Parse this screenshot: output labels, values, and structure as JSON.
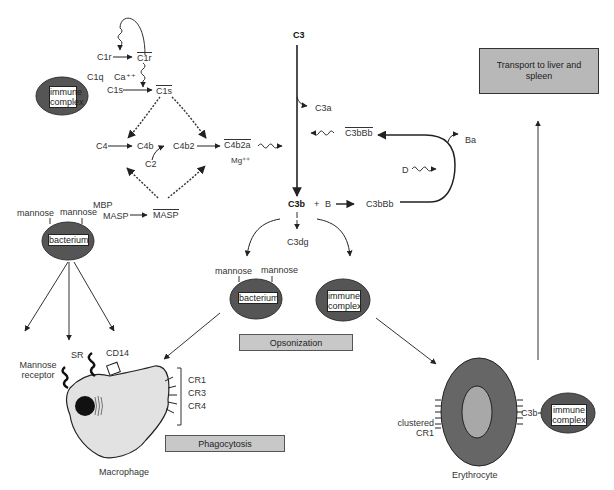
{
  "classical": {
    "c1r_left": "C1r",
    "c1r_right": "C1r",
    "c1q": "C1q",
    "ca": "Ca⁺⁺",
    "c1s_left": "C1s",
    "c1s_right": "C1s",
    "c4": "C4",
    "c4b": "C4b",
    "c2": "C2",
    "c4b2": "C4b2",
    "c4b2a": "C4b2a",
    "mg": "Mg⁺⁺",
    "immune_complex_top": "immune complex"
  },
  "lectin": {
    "mbp": "MBP",
    "masp_left": "MASP",
    "masp_right": "MASP",
    "mannose_1": "mannose",
    "mannose_2": "mannose",
    "bacterium": "bacterium"
  },
  "alternative": {
    "c3": "C3",
    "c3a": "C3a",
    "c3bbb_top": "C3bBb",
    "ba": "Ba",
    "d": "D",
    "c3b": "C3b",
    "plus": "+",
    "b": "B",
    "c3bbb": "C3bBb",
    "c3dg": "C3dg"
  },
  "opsonization": {
    "mannose_1": "mannose",
    "mannose_2": "mannose",
    "bacterium": "bacterium",
    "immune_complex": "immune complex",
    "label": "Opsonization"
  },
  "macrophage": {
    "mannose_receptor": "Mannose receptor",
    "sr": "SR",
    "cd14": "CD14",
    "cr1": "CR1",
    "cr3": "CR3",
    "cr4": "CR4",
    "name": "Macrophage",
    "phagocytosis": "Phagocytosis"
  },
  "erythrocyte": {
    "clustered_cr1": "clustered CR1",
    "c3b": "C3b",
    "immune_complex": "immune complex",
    "name": "Erythrocyte"
  },
  "transport": {
    "label": "Transport to liver and spleen"
  },
  "colors": {
    "dark_oval": "#555555",
    "box_gray": "#c8c8c8",
    "cell_light": "#e2e2e2",
    "erythrocyte_core": "#a8a8a8"
  }
}
